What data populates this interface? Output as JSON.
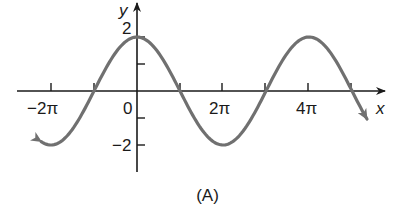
{
  "chart_data": {
    "type": "line",
    "title": "",
    "caption": "(A)",
    "xlabel": "x",
    "ylabel": "y",
    "function": "y = 2cos(x/2)",
    "x_ticks": [
      {
        "value": -6.2832,
        "label": "−2π"
      },
      {
        "value": -3.1416,
        "label": ""
      },
      {
        "value": 0,
        "label": "0"
      },
      {
        "value": 3.1416,
        "label": ""
      },
      {
        "value": 6.2832,
        "label": "2π"
      },
      {
        "value": 9.4248,
        "label": ""
      },
      {
        "value": 12.5664,
        "label": "4π"
      },
      {
        "value": 15.708,
        "label": ""
      }
    ],
    "y_ticks": [
      {
        "value": 2,
        "label": "2"
      },
      {
        "value": 1,
        "label": ""
      },
      {
        "value": -1,
        "label": ""
      },
      {
        "value": -2,
        "label": "−2"
      }
    ],
    "xlim": [
      -7.3,
      17.5
    ],
    "ylim": [
      -3,
      3.2
    ],
    "series": [
      {
        "name": "curve",
        "color": "#707070",
        "x": [
          -7.0,
          -6.2832,
          -4.7124,
          -3.1416,
          -1.5708,
          0,
          1.5708,
          3.1416,
          4.7124,
          6.2832,
          7.854,
          9.4248,
          10.9956,
          12.5664,
          14.1372,
          15.708,
          16.8
        ],
        "values": [
          -1.87,
          -2,
          -1.414,
          0,
          1.414,
          2,
          1.414,
          0,
          -1.414,
          -2,
          -1.414,
          0,
          1.414,
          2,
          1.414,
          0,
          -1.1
        ]
      }
    ],
    "grid": false,
    "legend": null,
    "arrows": {
      "left_end": true,
      "right_end": true,
      "x_axis": true,
      "y_axis": true
    }
  },
  "labels": {
    "x_axis": "x",
    "y_axis": "y",
    "tick_neg2pi": "−2π",
    "tick_0": "0",
    "tick_2pi": "2π",
    "tick_4pi": "4π",
    "tick_y2": "2",
    "tick_yneg2": "−2",
    "caption": "(A)"
  }
}
